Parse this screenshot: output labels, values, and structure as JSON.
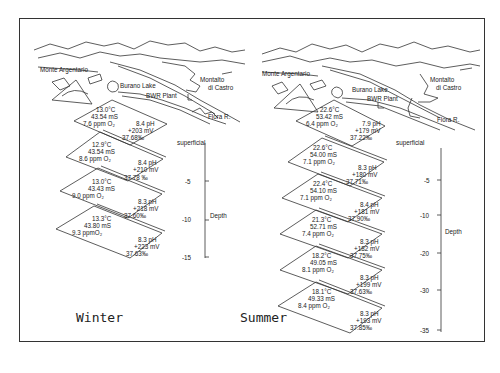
{
  "figure": {
    "landmarks": {
      "monte_argentario": "Monte Argentario",
      "burano_lake": "Burano Lake",
      "bwr_plant": "BWR Plant",
      "montalto": "Montalto",
      "di_castro": "di Castro",
      "fiora": "Flora R."
    },
    "axis": {
      "superficial": "superficial",
      "depth": "Depth"
    },
    "winter": {
      "label": "Winter",
      "ticks": [
        "-5",
        "-10",
        "-15"
      ],
      "layers": [
        {
          "temp": "13.0°C",
          "cond": "43.54 mS",
          "oxy": "7.6 ppm O₂",
          "ph": "8.4 pH",
          "mv": "+203 mV",
          "sal": "37.68‰"
        },
        {
          "temp": "12.9°C",
          "cond": "43.54 mS",
          "oxy": "8.6 ppm O₂",
          "ph": "8.4 pH",
          "mv": "+210 mV",
          "sal": "37.78 ‰"
        },
        {
          "temp": "13.0°C",
          "cond": "43.43 mS",
          "oxy": "9.0 ppm O₂",
          "ph": "8.3 pH",
          "mv": "+218 mV",
          "sal": "37.60‰"
        },
        {
          "temp": "13.3°C",
          "cond": "43.80 mS",
          "oxy": "9.3 ppmO₂",
          "ph": "8.3 pH",
          "mv": "+223 mV",
          "sal": "37.63‰"
        }
      ]
    },
    "summer": {
      "label": "Summer",
      "ticks": [
        "-5",
        "-10",
        "-20",
        "-30",
        "-35"
      ],
      "layers": [
        {
          "temp": "22.6°C",
          "cond": "53.42 mS",
          "oxy": "6.4 ppm O₂",
          "ph": "7.9 pH",
          "mv": "+179 mV",
          "sal": "37.22‰"
        },
        {
          "temp": "22.6°C",
          "cond": "54.00 mS",
          "oxy": "7.1 ppm O₂",
          "ph": "8.3 pH",
          "mv": "+180 mV",
          "sal": "37.71‰"
        },
        {
          "temp": "22.4°C",
          "cond": "54.10 mS",
          "oxy": "7.1 ppm O₂",
          "ph": "8.4 pH",
          "mv": "+181 mV",
          "sal": "37.90‰"
        },
        {
          "temp": "21.3°C",
          "cond": "52.71 mS",
          "oxy": "7.4 ppm O₂",
          "ph": "8.3 pH",
          "mv": "+182 mV",
          "sal": "37.75‰"
        },
        {
          "temp": "18.2°C",
          "cond": "49.05 mS",
          "oxy": "8.1 ppm O₂",
          "ph": "8.3 pH",
          "mv": "+199 mV",
          "sal": "37.63‰"
        },
        {
          "temp": "18.1°C",
          "cond": "49.33 mS",
          "oxy": "8.4 ppm O₂",
          "ph": "8.3 pH",
          "mv": "+193 mV",
          "sal": "37.85‰"
        }
      ]
    }
  }
}
